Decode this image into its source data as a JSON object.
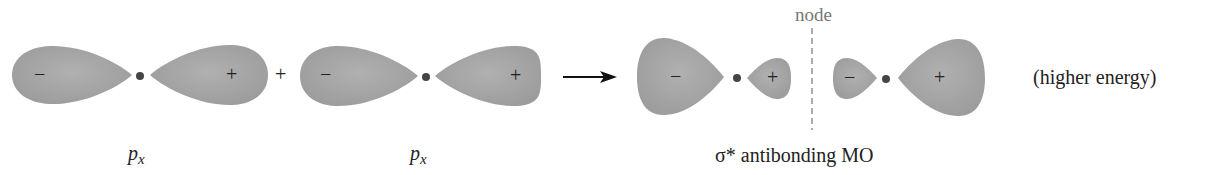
{
  "diagram": {
    "operator_plus": "+",
    "colors": {
      "lobe_fill": "#a6a6a6",
      "lobe_edge": "#9a9a9a",
      "nucleus": "#444444",
      "text": "#222222",
      "node_line": "#888888"
    },
    "orbitals": [
      {
        "id": "px-1",
        "label_main": "p",
        "label_sub": "x",
        "left_sign": "−",
        "right_sign": "+"
      },
      {
        "id": "px-2",
        "label_main": "p",
        "label_sub": "x",
        "left_sign": "−",
        "right_sign": "+"
      }
    ],
    "result": {
      "label": "σ* antibonding MO",
      "node_label": "node",
      "note": "(higher energy)",
      "signs": [
        "−",
        "+",
        "−",
        "+"
      ]
    }
  }
}
